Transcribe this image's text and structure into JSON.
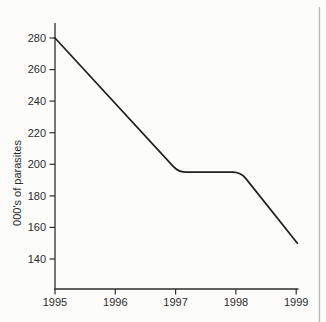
{
  "figure": {
    "background_color": "#fcfcfb",
    "axis_color": "#2e2e2e",
    "text_color": "#2b2b2b",
    "page_edge_color": "#b5b5b5"
  },
  "chart_data": {
    "type": "line",
    "title": "",
    "xlabel": "",
    "ylabel": "000's of parasites",
    "x_ticks": [
      "1995",
      "1996",
      "1997",
      "1998",
      "1999"
    ],
    "y_ticks": [
      140,
      160,
      180,
      200,
      220,
      240,
      260,
      280
    ],
    "xlim": [
      1995,
      1999
    ],
    "ylim": [
      140,
      280
    ],
    "grid": false,
    "legend": false,
    "series": [
      {
        "name": "parasite-count",
        "color": "#1f1f1f",
        "points": [
          [
            1995,
            280
          ],
          [
            1997.05,
            195
          ],
          [
            1998.08,
            195
          ],
          [
            1999.02,
            150
          ]
        ],
        "values_by_year": {
          "1995": 280,
          "1996": 240,
          "1997": 197,
          "1998": 195,
          "1999": 150
        }
      }
    ]
  }
}
